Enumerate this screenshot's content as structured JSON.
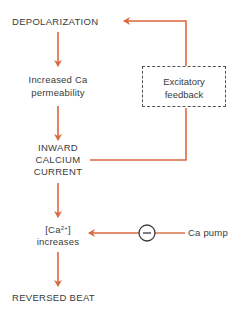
{
  "diagram": {
    "type": "flowchart",
    "colors": {
      "arrow": "#d9693e",
      "text": "#3a3a3a",
      "box_border": "#555555"
    },
    "nodes": {
      "depolarization": "DEPOLARIZATION",
      "permeability_line1": "Increased Ca",
      "permeability_line2": "permeability",
      "current_line1": "INWARD",
      "current_line2": "CALCIUM",
      "current_line3": "CURRENT",
      "ca_conc_prefix": "[Ca",
      "ca_conc_sup": "2+",
      "ca_conc_suffix": "]",
      "ca_increases": "increases",
      "reversed_beat": "REVERSED BEAT",
      "feedback_line1": "Excitatory",
      "feedback_line2": "feedback",
      "ca_pump": "Ca pump",
      "inhibit_symbol": "−"
    },
    "edges": [
      {
        "from": "DEPOLARIZATION",
        "to": "Increased Ca permeability"
      },
      {
        "from": "Increased Ca permeability",
        "to": "INWARD CALCIUM CURRENT"
      },
      {
        "from": "INWARD CALCIUM CURRENT",
        "to": "Excitatory feedback"
      },
      {
        "from": "Excitatory feedback",
        "to": "DEPOLARIZATION"
      },
      {
        "from": "INWARD CALCIUM CURRENT",
        "to": "[Ca2+] increases"
      },
      {
        "from": "Ca pump",
        "to": "[Ca2+] increases",
        "sign": "negative"
      },
      {
        "from": "[Ca2+] increases",
        "to": "REVERSED BEAT"
      }
    ]
  }
}
